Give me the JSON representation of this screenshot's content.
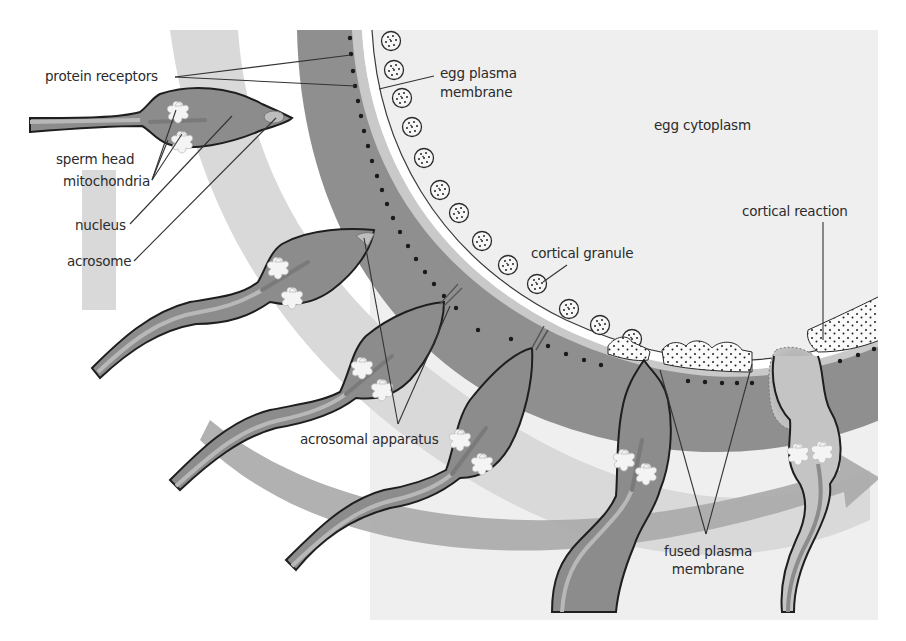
{
  "diagram": {
    "colors": {
      "background": "#ffffff",
      "cytoplasm": "#efefef",
      "zona_pellucida": "#8f8f8f",
      "light_band": "#d6d6d6",
      "arrow_band": "#a8a8a8",
      "sperm_body": "#8c8c8c",
      "sperm_outline": "#1e1e1e",
      "mitochondria": "#f4f4f4",
      "receptor_dot": "#1a1a1a",
      "granule_fill": "#f6f6f6",
      "label_text": "#2b2b2b",
      "leader_line": "#333333"
    },
    "labels": {
      "protein_receptors": "protein receptors",
      "egg_plasma_membrane_l1": "egg plasma",
      "egg_plasma_membrane_l2": "membrane",
      "egg_cytoplasm": "egg cytoplasm",
      "sperm_head": "sperm head",
      "mitochondria": "mitochondria",
      "nucleus": "nucleus",
      "acrosome": "acrosome",
      "cortical_granule": "cortical granule",
      "cortical_reaction": "cortical reaction",
      "acrosomal_apparatus": "acrosomal apparatus",
      "fused_plasma_membrane_l1": "fused plasma",
      "fused_plasma_membrane_l2": "membrane"
    },
    "structures": [
      {
        "name": "sperm",
        "count": 6
      },
      {
        "name": "zona pellucida with protein receptors"
      },
      {
        "name": "cortical granules",
        "count": 13
      },
      {
        "name": "process arrow",
        "direction": "left-to-right"
      }
    ]
  }
}
